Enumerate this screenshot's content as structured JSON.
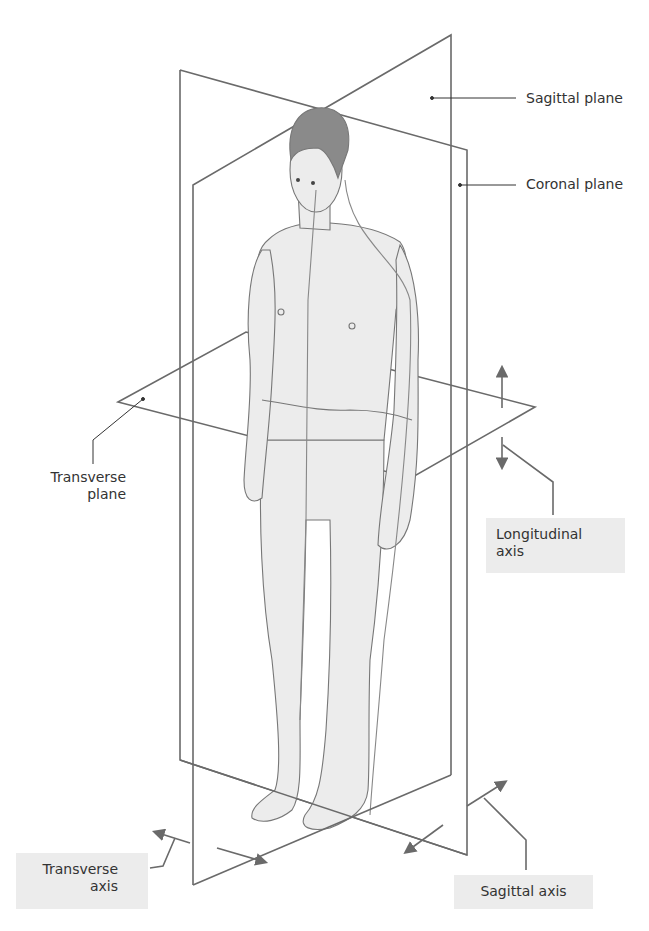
{
  "figure": {
    "type": "anatomical planes and axes diagram",
    "colors": {
      "plane_line": "#6a6a6a",
      "body_fill": "#ececec",
      "body_outline": "#777777",
      "hair": "#8a8a8a",
      "label_box": "#ececec",
      "text": "#333333"
    }
  },
  "labels": {
    "sagittal_plane": "Sagittal plane",
    "coronal_plane": "Coronal plane",
    "transverse_plane_line1": "Transverse",
    "transverse_plane_line2": "plane",
    "longitudinal_axis_line1": "Longitudinal",
    "longitudinal_axis_line2": "axis",
    "transverse_axis_line1": "Transverse",
    "transverse_axis_line2": "axis",
    "sagittal_axis": "Sagittal axis"
  }
}
